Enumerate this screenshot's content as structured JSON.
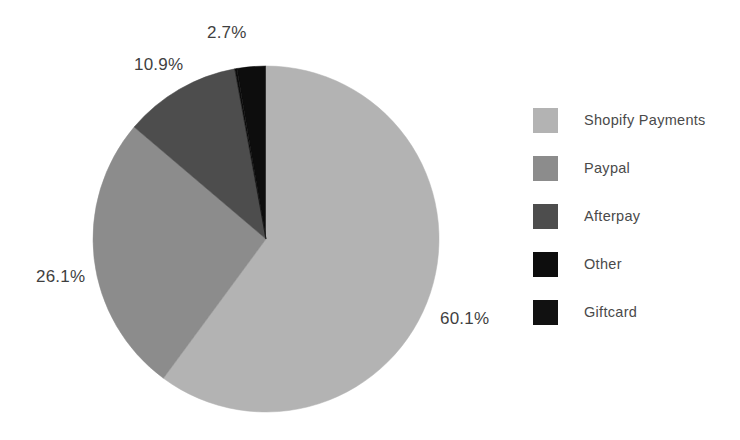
{
  "chart_data": {
    "type": "pie",
    "title": "",
    "subtitle": "",
    "xlabel": "",
    "ylabel": "",
    "grid": false,
    "legend_position": "right",
    "total_percent": 100.0,
    "start_angle_deg": -9.7,
    "direction": "clockwise",
    "categories": [
      "Other",
      "Shopify Payments",
      "Paypal",
      "Afterpay",
      "Giftcard"
    ],
    "values": [
      2.7,
      60.1,
      26.1,
      10.9,
      0.2
    ],
    "colors": [
      "#0d0d0d",
      "#b3b3b3",
      "#8c8c8c",
      "#4d4d4d",
      "#0d0d0d"
    ],
    "slices": [
      {
        "label": "Other",
        "value": 2.7,
        "display": "2.7%",
        "color": "#0d0d0d"
      },
      {
        "label": "Shopify Payments",
        "value": 60.1,
        "display": "60.1%",
        "color": "#b3b3b3"
      },
      {
        "label": "Paypal",
        "value": 26.1,
        "display": "26.1%",
        "color": "#8c8c8c"
      },
      {
        "label": "Afterpay",
        "value": 10.9,
        "display": "10.9%",
        "color": "#4d4d4d"
      },
      {
        "label": "Giftcard",
        "value": 0.2,
        "display": "",
        "color": "#0d0d0d"
      }
    ],
    "data_labels": [
      "2.7%",
      "60.1%",
      "26.1%",
      "10.9%"
    ]
  },
  "pie": {
    "center_x": 266,
    "center_y": 239,
    "radius": 173,
    "labels": {
      "other": "2.7%",
      "afterpay": "10.9%",
      "paypal": "26.1%",
      "shopify_payments": "60.1%"
    }
  },
  "legend": {
    "items": [
      {
        "label": "Shopify Payments",
        "color": "#b3b3b3"
      },
      {
        "label": "Paypal",
        "color": "#8c8c8c"
      },
      {
        "label": "Afterpay",
        "color": "#4d4d4d"
      },
      {
        "label": "Other",
        "color": "#0d0d0d"
      },
      {
        "label": "Giftcard",
        "color": "#111111"
      }
    ]
  }
}
